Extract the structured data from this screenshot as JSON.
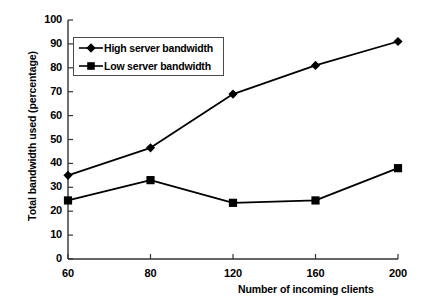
{
  "chart_data": {
    "type": "line",
    "title": "",
    "xlabel": "Number of incoming clients",
    "ylabel": "Total bandwidth used (percentage)",
    "categories": [
      "60",
      "80",
      "120",
      "160",
      "200"
    ],
    "ylim": [
      0,
      100
    ],
    "yticks": [
      "0",
      "10",
      "20",
      "30",
      "40",
      "50",
      "60",
      "70",
      "80",
      "90",
      "100"
    ],
    "grid": false,
    "legend_position": "upper-left-inside",
    "series": [
      {
        "name": "High server bandwidth",
        "marker": "diamond",
        "color": "#000000",
        "values": [
          35,
          46.5,
          69,
          81,
          91
        ]
      },
      {
        "name": "Low server bandwidth",
        "marker": "square",
        "color": "#000000",
        "values": [
          24.5,
          33,
          23.5,
          24.5,
          38
        ]
      }
    ]
  }
}
